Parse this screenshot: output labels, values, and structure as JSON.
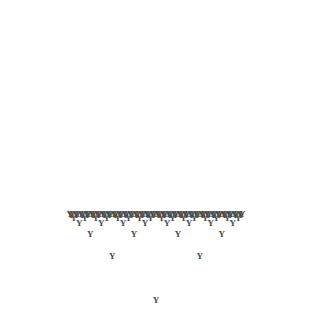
{
  "figure": {
    "type": "fractal",
    "glyph": "Y",
    "glyph_name": "letter-y-glyph",
    "background_color": "#ffffff",
    "stroke_color": "#4a4a4a",
    "width": 311,
    "height": 326
  },
  "fractal": {
    "kind": "binary-branching-letter-tree",
    "root": {
      "x": 156,
      "y": 303
    },
    "root_glyph_size": 9,
    "glyph_size": 9,
    "glyph_size_uniform": true,
    "initial_branch_length": 62,
    "length_ratio": 0.5,
    "branch_angle_degrees": 45,
    "trunk_angle_degrees": 90,
    "depth": 6,
    "total_glyphs": 127,
    "branch_directions": [
      "up-left",
      "up-right"
    ],
    "symmetry": "bilateral-vertical",
    "bounds": {
      "left": 16,
      "top": 16,
      "right": 296,
      "bottom": 308
    }
  },
  "chart_data": {
    "type": "scatter",
    "xlabel": "",
    "ylabel": "",
    "xlim": [
      0,
      311
    ],
    "ylim": [
      326,
      0
    ],
    "grid": false,
    "legend": "none",
    "marker": "Y",
    "marker_color": "#4a4a4a",
    "levels": [
      {
        "level": 0,
        "count": 1,
        "branch_length": 62
      },
      {
        "level": 1,
        "count": 2,
        "branch_length": 31
      },
      {
        "level": 2,
        "count": 4,
        "branch_length": 15.5
      },
      {
        "level": 3,
        "count": 8,
        "branch_length": 7.75
      },
      {
        "level": 4,
        "count": 16,
        "branch_length": 3.88
      },
      {
        "level": 5,
        "count": 32,
        "branch_length": 1.94
      },
      {
        "level": 6,
        "count": 64,
        "branch_length": 0.97
      }
    ]
  }
}
